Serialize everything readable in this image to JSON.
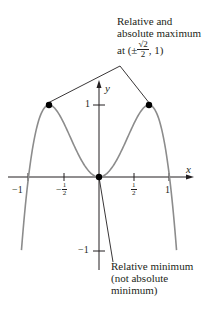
{
  "figure": {
    "x_axis_label": "x",
    "y_axis_label": "y",
    "x_ticks": [
      {
        "label": "−1",
        "value": -1
      },
      {
        "label_sign": "−",
        "label_num": "1",
        "label_den": "2",
        "value": -0.5
      },
      {
        "label_num": "1",
        "label_den": "2",
        "value": 0.5
      },
      {
        "label": "1",
        "value": 1
      }
    ],
    "y_ticks": [
      {
        "label": "1",
        "value": 1
      },
      {
        "label": "−1",
        "value": -1
      }
    ],
    "annotations": {
      "max": {
        "line1": "Relative and",
        "line2": "absolute maximum",
        "line3_prefix": "at (±",
        "line3_num": "√2",
        "line3_den": "2",
        "line3_suffix": ", 1)"
      },
      "min": {
        "line1": "Relative minimum",
        "line2": "(not absolute",
        "line3": "minimum)"
      }
    },
    "colors": {
      "curve": "#8c8c8c",
      "axes": "#231f20",
      "points": "#000000"
    }
  },
  "chart_data": {
    "type": "line",
    "title": "",
    "xlabel": "x",
    "ylabel": "y",
    "function": "y = 4x^2(1 - x^2)",
    "xlim": [
      -1.1,
      1.1
    ],
    "ylim": [
      -1.2,
      1.4
    ],
    "x_tick_labels": [
      "-1",
      "-1/2",
      "1/2",
      "1"
    ],
    "y_tick_labels": [
      "1",
      "-1"
    ],
    "marked_points": [
      {
        "x": -0.7071,
        "y": 1,
        "label": "Relative and absolute maximum"
      },
      {
        "x": 0.7071,
        "y": 1,
        "label": "Relative and absolute maximum"
      },
      {
        "x": 0,
        "y": 0,
        "label": "Relative minimum (not absolute minimum)"
      }
    ],
    "grid": false,
    "legend": "none"
  }
}
